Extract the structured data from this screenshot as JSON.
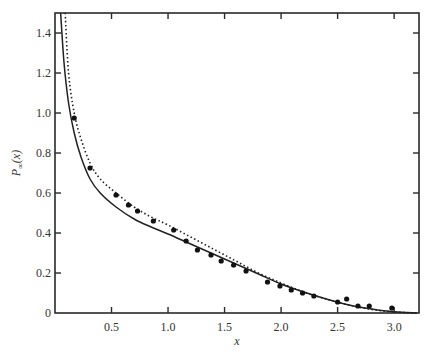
{
  "chart_data": {
    "type": "line",
    "title": "",
    "xlabel": "x",
    "ylabel": "P∞(x)",
    "xlim": [
      0,
      3.22
    ],
    "ylim": [
      0,
      1.5
    ],
    "xticks": [
      0.5,
      1.0,
      1.5,
      2.0,
      2.5,
      3.0
    ],
    "xtick_labels": [
      "0.5",
      "1.0",
      "1.5",
      "2.0",
      "2.5",
      "3.0"
    ],
    "yticks": [
      0,
      0.2,
      0.4,
      0.6,
      0.8,
      1.0,
      1.2,
      1.4
    ],
    "ytick_labels": [
      "0",
      "0.2",
      "0.4",
      "0.6",
      "0.8",
      "1.0",
      "1.2",
      "1.4"
    ],
    "grid": false,
    "legend": null,
    "series": [
      {
        "name": "solid curve",
        "style": "solid",
        "x": [
          0.05,
          0.08,
          0.12,
          0.17,
          0.23,
          0.31,
          0.4,
          0.54,
          0.7,
          0.85,
          1.0,
          1.2,
          1.4,
          1.6,
          1.8,
          2.0,
          2.2,
          2.4,
          2.6,
          2.8,
          3.0,
          3.2
        ],
        "y": [
          1.5,
          1.25,
          1.05,
          0.9,
          0.78,
          0.67,
          0.6,
          0.53,
          0.47,
          0.43,
          0.395,
          0.345,
          0.295,
          0.245,
          0.195,
          0.145,
          0.105,
          0.07,
          0.04,
          0.02,
          0.006,
          0.0
        ]
      },
      {
        "name": "dotted curve",
        "style": "dotted",
        "x": [
          0.09,
          0.12,
          0.17,
          0.23,
          0.31,
          0.4,
          0.54,
          0.7,
          0.85,
          1.0,
          1.2,
          1.4,
          1.6,
          1.8,
          2.0,
          2.2,
          2.4,
          2.6,
          2.8,
          3.0,
          3.2
        ],
        "y": [
          1.5,
          1.2,
          1.0,
          0.87,
          0.75,
          0.67,
          0.6,
          0.53,
          0.48,
          0.44,
          0.38,
          0.32,
          0.26,
          0.2,
          0.15,
          0.105,
          0.07,
          0.04,
          0.018,
          0.005,
          0.0
        ]
      },
      {
        "name": "data points",
        "style": "markers",
        "x": [
          0.17,
          0.31,
          0.54,
          0.65,
          0.73,
          0.87,
          1.05,
          1.16,
          1.26,
          1.38,
          1.47,
          1.58,
          1.69,
          1.88,
          1.99,
          2.09,
          2.19,
          2.29,
          2.5,
          2.58,
          2.68,
          2.78,
          2.98
        ],
        "y": [
          0.975,
          0.725,
          0.59,
          0.54,
          0.51,
          0.46,
          0.415,
          0.36,
          0.315,
          0.29,
          0.26,
          0.24,
          0.21,
          0.155,
          0.135,
          0.115,
          0.1,
          0.085,
          0.055,
          0.07,
          0.035,
          0.035,
          0.025
        ]
      }
    ]
  },
  "labels": {
    "xlabel": "x",
    "ylabel_main": "P",
    "ylabel_sub": "∞",
    "ylabel_arg": "(x)"
  },
  "colors": {
    "axis": "#2a2a2a",
    "line": "#222222",
    "marker": "#111111",
    "text": "#333333"
  }
}
